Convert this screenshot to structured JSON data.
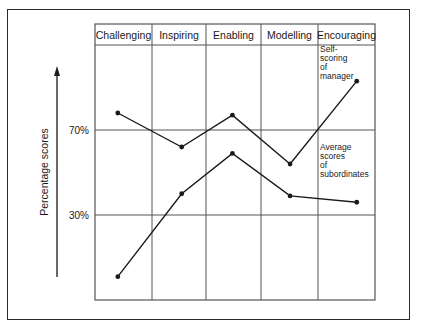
{
  "chart_data": {
    "type": "line",
    "title": "",
    "xlabel": "",
    "ylabel": "Percentage scores",
    "categories": [
      "Challenging",
      "Inspiring",
      "Enabling",
      "Modelling",
      "Encouraging"
    ],
    "series": [
      {
        "name": "Self-scoring of manager",
        "label_lines": [
          "Self-",
          "scoring",
          "of",
          "manager"
        ],
        "values": [
          78,
          62,
          77,
          54,
          93
        ]
      },
      {
        "name": "Average scores of subordinates",
        "label_lines": [
          "Average",
          "scores",
          "of",
          "subordinates"
        ],
        "values": [
          1,
          40,
          59,
          39,
          36
        ]
      }
    ],
    "yticks": [
      {
        "value": 70,
        "label": "70%"
      },
      {
        "value": 30,
        "label": "30%"
      }
    ],
    "ylim": [
      0,
      100
    ],
    "grid": true,
    "legend_position": "inline annotations in Encouraging column",
    "point_x_fraction": [
      0.4,
      0.55,
      0.48,
      0.51,
      0.68
    ]
  },
  "colors": {
    "line": "#1a1a1a",
    "grid": "#555555",
    "frame": "#2a2a2a"
  }
}
